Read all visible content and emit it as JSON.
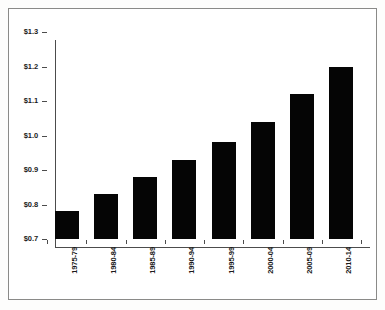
{
  "chart_data": {
    "type": "bar",
    "title": "",
    "subtitle": "",
    "xlabel": "",
    "ylabel": "",
    "categories": [
      "1975-79",
      "1980-84",
      "1985-89",
      "1990-94",
      "1995-99",
      "2000-04",
      "2005-09",
      "2010-14"
    ],
    "values": [
      0.78,
      0.83,
      0.88,
      0.93,
      0.98,
      1.04,
      1.12,
      1.2
    ],
    "ylim": [
      0.7,
      1.3
    ],
    "ytick_values": [
      0.7,
      0.8,
      0.9,
      1.0,
      1.1,
      1.2,
      1.3
    ],
    "ytick_labels": [
      "$0.7",
      "$0.8",
      "$0.9",
      "$1.0",
      "$1.1",
      "$1.2",
      "$1.3"
    ],
    "grid": false,
    "legend": false,
    "legend_position": "none",
    "bar_color": "#050505",
    "axis_color": "#4c4c4c",
    "text_color": "#1b1b1b",
    "background_color": "#ffffff",
    "frame_color": "#8a8a88"
  }
}
